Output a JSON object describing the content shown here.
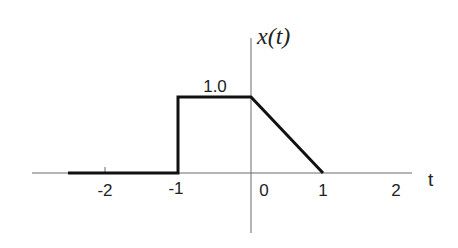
{
  "diagram": {
    "title": "x(t)",
    "x_axis_label": "t",
    "y_axis_label": "x(t)",
    "value_label": "1.0",
    "x_ticks": [
      {
        "value": -2,
        "label": "-2"
      },
      {
        "value": -1,
        "label": "-1"
      },
      {
        "value": 0,
        "label": "0"
      },
      {
        "value": 1,
        "label": "1"
      },
      {
        "value": 2,
        "label": "2"
      }
    ],
    "signal_points": [
      {
        "t": -2.5,
        "x": 0
      },
      {
        "t": -1,
        "x": 0
      },
      {
        "t": -1,
        "x": 1.0
      },
      {
        "t": 0,
        "x": 1.0
      },
      {
        "t": 1,
        "x": 0
      }
    ],
    "colors": {
      "signal": "#111111",
      "axis": "#6a6a6a",
      "background": "#ffffff"
    }
  }
}
